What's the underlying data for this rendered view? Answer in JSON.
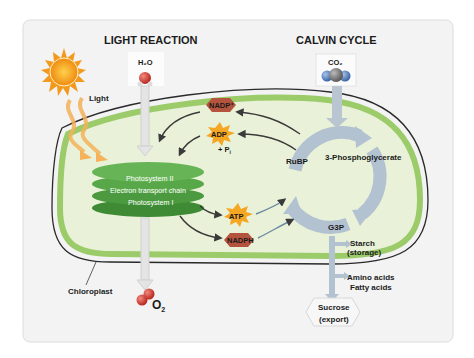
{
  "titles": {
    "light_reaction": "LIGHT REACTION",
    "calvin_cycle": "CALVIN CYCLE"
  },
  "inputs": {
    "light": "Light",
    "water": "H₂O",
    "co2": "CO₂"
  },
  "outputs": {
    "oxygen_base": "O",
    "oxygen_sub": "2"
  },
  "thylakoid": {
    "line1": "Photosystem II",
    "line2": "Electron transport chain",
    "line3": "Photosystem I"
  },
  "energy_carriers": {
    "nadp_plus": "NADP⁺",
    "adp": "ADP",
    "pi": "+ P",
    "pi_sub": "i",
    "atp": "ATP",
    "nadph": "NADPH"
  },
  "calvin": {
    "rubp": "RuBP",
    "pga": "3-Phosphoglycerate",
    "g3p": "G3P"
  },
  "products": {
    "starch_1": "Starch",
    "starch_2": "(storage)",
    "amino": "Amino acids",
    "fatty": "Fatty acids",
    "sucrose_1": "Sucrose",
    "sucrose_2": "(export)"
  },
  "labels": {
    "chloroplast": "Chloroplast"
  },
  "colors": {
    "card_bg": "#f3f3f3",
    "stroma": "#e9f2d8",
    "membrane": "#9ccb6a",
    "outer_line": "#2a2a2a",
    "thylakoid": "#5aa54a",
    "calvin_arrow": "#a9b9c9",
    "sun": "#f39a1e",
    "atp": "#f5a623",
    "nadp": "#b5543e",
    "o2": "#d6453a",
    "co2": "#5a87c4"
  }
}
